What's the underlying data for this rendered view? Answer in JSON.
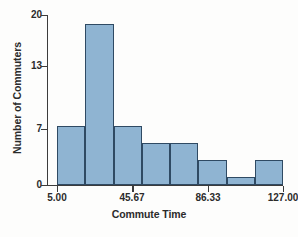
{
  "chart_data": {
    "type": "bar",
    "title": "",
    "xlabel": "Commute Time",
    "ylabel": "Number of Commuters",
    "categories": [
      "5.00-20.25",
      "20.25-35.50",
      "35.50-50.75",
      "50.75-66.00",
      "66.00-81.25",
      "81.25-96.50",
      "96.50-111.75",
      "111.75-127.00"
    ],
    "values": [
      7,
      19,
      7,
      5,
      5,
      3,
      1,
      3
    ],
    "bin_edges": [
      5.0,
      20.25,
      35.5,
      50.75,
      66.0,
      81.25,
      96.5,
      111.75,
      127.0
    ],
    "bin_width": 15.25,
    "xlim": [
      5.0,
      127.0
    ],
    "ylim": [
      0,
      20
    ],
    "x_ticks": [
      5.0,
      45.67,
      86.33,
      127.0
    ],
    "x_tick_labels": [
      "5.00",
      "45.67",
      "86.33",
      "127.00"
    ],
    "y_ticks": [
      0,
      7,
      13,
      20
    ],
    "y_tick_labels": [
      "0",
      "7",
      "13",
      "20"
    ],
    "grid": false,
    "legend": false,
    "bar_fill_color": "#8FB4D2",
    "bar_edge_color": "#2F4A63",
    "axis_color": "#3C3C3C",
    "background_color": "#FDFDFC"
  }
}
